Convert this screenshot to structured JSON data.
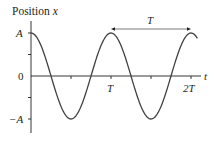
{
  "chart_data": {
    "type": "line",
    "title": "",
    "ylabel": "Position x",
    "ylabel_parts": {
      "text": "Position",
      "var": "x"
    },
    "xlabel": "t",
    "ytick_labels": [
      "A",
      "0",
      "−A"
    ],
    "ytick_values": [
      1,
      0,
      -1
    ],
    "xtick_labels": [
      "T",
      "2T"
    ],
    "xtick_values": [
      1,
      2
    ],
    "xlim": [
      0,
      2.1
    ],
    "ylim": [
      -1.15,
      1.35
    ],
    "grid": false,
    "legend": null,
    "series": [
      {
        "name": "x(t) = A cos(2πt/T)",
        "x": [
          0,
          0.125,
          0.25,
          0.375,
          0.5,
          0.625,
          0.75,
          0.875,
          1.0,
          1.125,
          1.25,
          1.375,
          1.5,
          1.625,
          1.75,
          1.875,
          2.0,
          2.08
        ],
        "values": [
          1,
          0.707,
          0,
          -0.707,
          -1,
          -0.707,
          0,
          0.707,
          1,
          0.707,
          0,
          -0.707,
          -1,
          -0.707,
          0,
          0.707,
          1,
          0.88
        ]
      }
    ],
    "annotations": [
      {
        "type": "double-arrow",
        "from_x": 1,
        "to_x": 2,
        "label": "T",
        "position": "above peaks"
      }
    ],
    "minor_ticks_x": [
      0.5,
      1.5
    ],
    "minor_ticks_y": [
      0.5,
      -0.5
    ]
  }
}
